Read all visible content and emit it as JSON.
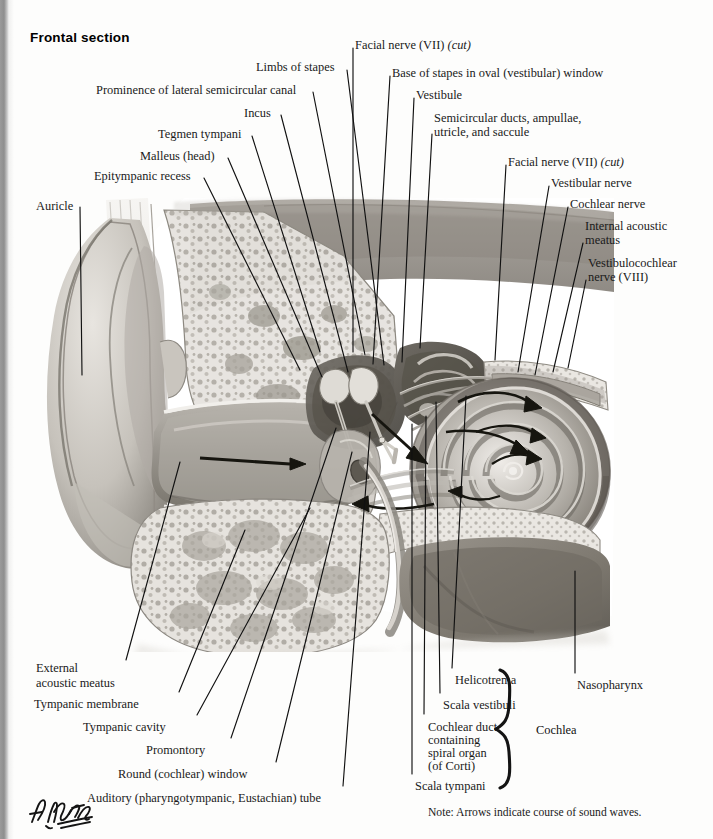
{
  "title": "Frontal section",
  "note": "Note: Arrows indicate course of sound waves.",
  "signature": "F. Netter",
  "brace_label": "Cochlea",
  "colors": {
    "ink": "#1a1a1a",
    "leader": "#111111",
    "paper": "#fdfdfc",
    "gutter": "#8e8e8e"
  },
  "labels": [
    {
      "id": "limbs-of-stapes",
      "text": "Limbs of stapes",
      "x": 256,
      "y": 61,
      "align": "left"
    },
    {
      "id": "prominence-lsc",
      "text": "Prominence of lateral semicircular canal",
      "x": 96,
      "y": 84,
      "align": "left"
    },
    {
      "id": "incus",
      "text": "Incus",
      "x": 244,
      "y": 107,
      "align": "left"
    },
    {
      "id": "tegmen-tympani",
      "text": "Tegmen tympani",
      "x": 158,
      "y": 128,
      "align": "left"
    },
    {
      "id": "malleus-head",
      "text": "Malleus (head)",
      "x": 140,
      "y": 150,
      "align": "left"
    },
    {
      "id": "epitympanic-recess",
      "text": "Epitympanic recess",
      "x": 94,
      "y": 170,
      "align": "left"
    },
    {
      "id": "auricle",
      "text": "Auricle",
      "x": 36,
      "y": 200,
      "align": "left"
    },
    {
      "id": "facial-nerve-vii-cut-top",
      "text": "Facial nerve (VII) ",
      "italic": "(cut)",
      "x": 355,
      "y": 39,
      "align": "left"
    },
    {
      "id": "base-of-stapes",
      "text": "Base of stapes in oval (vestibular) window",
      "x": 392,
      "y": 67,
      "align": "left"
    },
    {
      "id": "vestibule",
      "text": "Vestibule",
      "x": 416,
      "y": 89,
      "align": "left"
    },
    {
      "id": "semicircular-ducts-l1",
      "text": "Semicircular ducts, ampullae,",
      "x": 434,
      "y": 112,
      "align": "left"
    },
    {
      "id": "semicircular-ducts-l2",
      "text": "utricle, and saccule",
      "x": 434,
      "y": 126,
      "align": "left"
    },
    {
      "id": "facial-nerve-vii-cut-right",
      "text": "Facial nerve (VII) ",
      "italic": "(cut)",
      "x": 508,
      "y": 156,
      "align": "left"
    },
    {
      "id": "vestibular-nerve",
      "text": "Vestibular nerve",
      "x": 551,
      "y": 177,
      "align": "left"
    },
    {
      "id": "cochlear-nerve",
      "text": "Cochlear nerve",
      "x": 570,
      "y": 198,
      "align": "left"
    },
    {
      "id": "internal-acoustic-meatus-l1",
      "text": "Internal acoustic",
      "x": 585,
      "y": 220,
      "align": "left"
    },
    {
      "id": "internal-acoustic-meatus-l2",
      "text": "meatus",
      "x": 585,
      "y": 234,
      "align": "left"
    },
    {
      "id": "vestibulocochlear-l1",
      "text": "Vestibulocochlear",
      "x": 588,
      "y": 257,
      "align": "left"
    },
    {
      "id": "vestibulocochlear-l2",
      "text": "nerve (VIII)",
      "x": 588,
      "y": 271,
      "align": "left"
    },
    {
      "id": "external-acoustic-meatus-l1",
      "text": "External",
      "x": 36,
      "y": 662,
      "align": "left"
    },
    {
      "id": "external-acoustic-meatus-l2",
      "text": "acoustic meatus",
      "x": 36,
      "y": 677,
      "align": "left"
    },
    {
      "id": "tympanic-membrane",
      "text": "Tympanic membrane",
      "x": 34,
      "y": 698,
      "align": "left"
    },
    {
      "id": "tympanic-cavity",
      "text": "Tympanic cavity",
      "x": 83,
      "y": 721,
      "align": "left"
    },
    {
      "id": "promontory",
      "text": "Promontory",
      "x": 146,
      "y": 744,
      "align": "left"
    },
    {
      "id": "round-cochlear-window",
      "text": "Round (cochlear) window",
      "x": 118,
      "y": 768,
      "align": "left"
    },
    {
      "id": "auditory-tube",
      "text": "Auditory (pharyngotympanic, Eustachian) tube",
      "x": 87,
      "y": 792,
      "align": "left"
    },
    {
      "id": "helicotrema",
      "text": "Helicotrema",
      "x": 455,
      "y": 674,
      "align": "left"
    },
    {
      "id": "scala-vestibuli",
      "text": "Scala vestibuli",
      "x": 443,
      "y": 699,
      "align": "left"
    },
    {
      "id": "cochlear-duct-l1",
      "text": "Cochlear duct",
      "x": 428,
      "y": 721,
      "align": "left"
    },
    {
      "id": "cochlear-duct-l2",
      "text": "containing",
      "x": 428,
      "y": 734,
      "align": "left"
    },
    {
      "id": "cochlear-duct-l3",
      "text": "spiral organ",
      "x": 428,
      "y": 747,
      "align": "left"
    },
    {
      "id": "cochlear-duct-l4",
      "text": "(of Corti)",
      "x": 428,
      "y": 760,
      "align": "left"
    },
    {
      "id": "scala-tympani",
      "text": "Scala tympani",
      "x": 415,
      "y": 780,
      "align": "left"
    },
    {
      "id": "nasopharynx",
      "text": "Nasopharynx",
      "x": 577,
      "y": 679,
      "align": "left"
    }
  ],
  "leaders": [
    {
      "id": "leader-limbs-of-stapes",
      "points": "347,70 384,365"
    },
    {
      "id": "leader-prominence-lsc",
      "points": "313,92 365,355"
    },
    {
      "id": "leader-incus",
      "points": "281,115 348,372"
    },
    {
      "id": "leader-tegmen-tympani",
      "points": "252,136 320,352"
    },
    {
      "id": "leader-malleus-head",
      "points": "228,158 322,377"
    },
    {
      "id": "leader-epitympanic-recess",
      "points": "204,178 300,370"
    },
    {
      "id": "leader-auricle",
      "points": "80,207 82,375"
    },
    {
      "id": "leader-facial-nerve-top",
      "points": "353,48 353,352"
    },
    {
      "id": "leader-base-of-stapes",
      "points": "390,76 373,364"
    },
    {
      "id": "leader-vestibule",
      "points": "414,98 402,362"
    },
    {
      "id": "leader-semicircular-ducts",
      "points": "432,134 420,348"
    },
    {
      "id": "leader-facial-nerve-right",
      "points": "506,165 495,360"
    },
    {
      "id": "leader-vestibular-nerve",
      "points": "549,186 518,372"
    },
    {
      "id": "leader-cochlear-nerve",
      "points": "568,207 535,375"
    },
    {
      "id": "leader-internal-acoustic-meatus",
      "points": "583,243 553,372"
    },
    {
      "id": "leader-vestibulocochlear",
      "points": "586,280 568,368"
    },
    {
      "id": "leader-external-acoustic-meatus",
      "points": "126,660 180,462"
    },
    {
      "id": "leader-tympanic-membrane",
      "points": "179,692 245,530"
    },
    {
      "id": "leader-tympanic-cavity",
      "points": "197,715 310,508"
    },
    {
      "id": "leader-promontory",
      "points": "231,738 336,428"
    },
    {
      "id": "leader-round-window",
      "points": "276,762 352,452"
    },
    {
      "id": "leader-auditory-tube",
      "points": "343,786 370,432"
    },
    {
      "id": "leader-helicotrema",
      "points": "452,668 466,396"
    },
    {
      "id": "leader-scala-vestibuli",
      "points": "440,693 436,402"
    },
    {
      "id": "leader-cochlear-duct",
      "points": "424,714 426,416"
    },
    {
      "id": "leader-scala-tympani",
      "points": "412,774 412,424"
    },
    {
      "id": "leader-nasopharynx",
      "points": "575,673 575,571"
    }
  ]
}
